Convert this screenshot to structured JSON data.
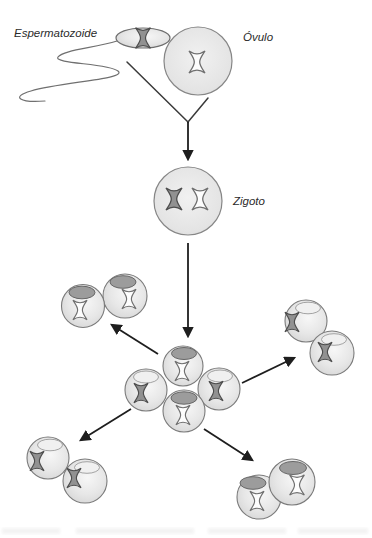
{
  "diagram": {
    "labels": {
      "sperm": "Espermatozoide",
      "egg": "Óvulo",
      "zygote": "Zigoto"
    },
    "colors": {
      "background": "#ffffff",
      "cell_fill": "#e3e3e3",
      "cell_outline": "#7a7a7a",
      "nucleus_dark": "#9c9c9c",
      "nucleus_light": "#f0f0f0",
      "chromosome_gray": "#919191",
      "chromosome_white": "#fdfdfd",
      "arrow": "#1e1e1e",
      "label_text": "#2b2b2b"
    }
  }
}
